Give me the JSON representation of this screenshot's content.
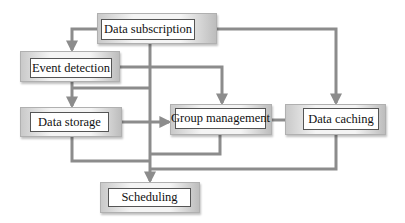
{
  "diagram": {
    "type": "flowchart",
    "line_color": "#8c8c8c",
    "nodes": {
      "data_subscription": {
        "label": "Data subscription"
      },
      "event_detection": {
        "label": "Event detection"
      },
      "data_storage": {
        "label": "Data storage"
      },
      "group_management": {
        "label": "Group management"
      },
      "data_caching": {
        "label": "Data caching"
      },
      "scheduling": {
        "label": "Scheduling"
      }
    },
    "edges": [
      {
        "from": "Data subscription",
        "to": "Event detection"
      },
      {
        "from": "Data subscription",
        "to": "Data caching"
      },
      {
        "from": "Data subscription",
        "to": "Scheduling"
      },
      {
        "from": "Event detection",
        "to": "Group management"
      },
      {
        "from": "Event detection",
        "to": "Data storage"
      },
      {
        "from": "Data storage",
        "to": "Group management"
      },
      {
        "from": "Data storage",
        "to": "Scheduling"
      },
      {
        "from": "Group management",
        "to": "Scheduling"
      },
      {
        "from": "Group management",
        "to": "Data caching"
      },
      {
        "from": "Data caching",
        "to": "Scheduling"
      }
    ]
  }
}
